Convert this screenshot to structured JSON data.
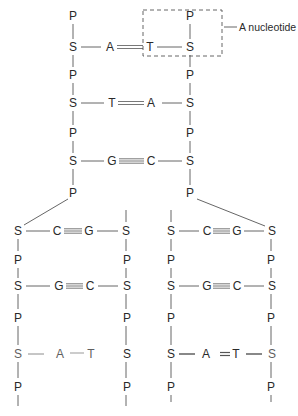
{
  "figure": {
    "callout_label": "A nucleotide"
  },
  "legend": {
    "P": "phosphate",
    "S": "sugar",
    "bases": [
      "A",
      "T",
      "G",
      "C"
    ]
  },
  "parent_molecule": {
    "left_strand": [
      "P",
      "S",
      "P",
      "S",
      "P",
      "S",
      "P"
    ],
    "right_strand": [
      "P",
      "S",
      "P",
      "S",
      "P",
      "S",
      "P"
    ],
    "base_pairs": [
      {
        "left": "A",
        "right": "T",
        "bonds": 2
      },
      {
        "left": "T",
        "right": "A",
        "bonds": 2
      },
      {
        "left": "G",
        "right": "C",
        "bonds": 3
      }
    ]
  },
  "daughter_left": {
    "left_strand": [
      "S",
      "P",
      "S",
      "P",
      "S",
      "P"
    ],
    "right_strand": [
      "S",
      "P",
      "S",
      "P",
      "S",
      "P"
    ],
    "base_pairs": [
      {
        "left": "C",
        "right": "G",
        "bonds": 3
      },
      {
        "left": "G",
        "right": "C",
        "bonds": 3
      },
      {
        "left": "A",
        "right": "T",
        "bonds": 2
      }
    ]
  },
  "daughter_right": {
    "left_strand": [
      "S",
      "P",
      "S",
      "P",
      "S",
      "P"
    ],
    "right_strand": [
      "S",
      "P",
      "S",
      "P",
      "S",
      "P"
    ],
    "base_pairs": [
      {
        "left": "C",
        "right": "G",
        "bonds": 3
      },
      {
        "left": "G",
        "right": "C",
        "bonds": 3
      },
      {
        "left": "A",
        "right": "T",
        "bonds": 2
      }
    ]
  }
}
